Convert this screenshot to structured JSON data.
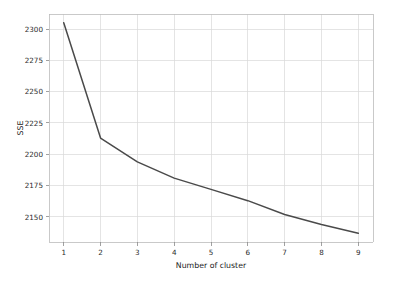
{
  "chart_data": {
    "type": "line",
    "title": "",
    "subtitle": "",
    "xlabel": "Number of cluster",
    "ylabel": "SSE",
    "x": [
      1,
      2,
      3,
      4,
      5,
      6,
      7,
      8,
      9
    ],
    "values": [
      2305,
      2213,
      2194,
      2181,
      2172,
      2163,
      2152,
      2144,
      2137
    ],
    "series": [
      {
        "name": "SSE",
        "values": [
          2305,
          2213,
          2194,
          2181,
          2172,
          2163,
          2152,
          2144,
          2137
        ]
      }
    ],
    "xticks": [
      "1",
      "2",
      "3",
      "4",
      "5",
      "6",
      "7",
      "8",
      "9"
    ],
    "yticks": [
      "2150",
      "2175",
      "2200",
      "2225",
      "2250",
      "2275",
      "2300"
    ],
    "xlim": [
      0.6,
      9.4
    ],
    "ylim": [
      2130,
      2312
    ],
    "grid": true,
    "legend": false,
    "legend_position": "none",
    "line_color": "#4a4a4a",
    "grid_color": "#d9d9d9",
    "background_color": "#ffffff",
    "markers": false,
    "annotations": []
  },
  "axis": {
    "x_title": "Number of cluster",
    "y_title": "SSE",
    "x_tick_labels": [
      "1",
      "2",
      "3",
      "4",
      "5",
      "6",
      "7",
      "8",
      "9"
    ],
    "y_tick_labels": [
      "2150",
      "2175",
      "2200",
      "2225",
      "2250",
      "2275",
      "2300"
    ]
  }
}
